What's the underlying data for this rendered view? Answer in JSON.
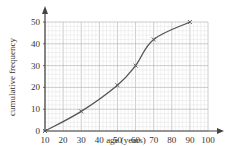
{
  "chart_data": {
    "type": "line",
    "title": "",
    "xlabel": "age (years)",
    "ylabel": "cumulative frequency",
    "xlim": [
      10,
      100
    ],
    "ylim": [
      0,
      50
    ],
    "x_ticks": [
      10,
      20,
      30,
      40,
      50,
      60,
      70,
      80,
      90,
      100
    ],
    "y_ticks": [
      0,
      10,
      20,
      30,
      40,
      50
    ],
    "grid": true,
    "legend": null,
    "series": [
      {
        "name": "cumulative frequency",
        "x": [
          10,
          30,
          50,
          60,
          70,
          90
        ],
        "values": [
          0,
          9,
          21,
          30,
          42,
          50
        ],
        "marker": "x",
        "smooth": true
      }
    ]
  },
  "colors": {
    "curve": "#555555",
    "axis": "#444444",
    "grid_major": "#b8b8b8",
    "grid_minor": "#e2e2e2"
  }
}
